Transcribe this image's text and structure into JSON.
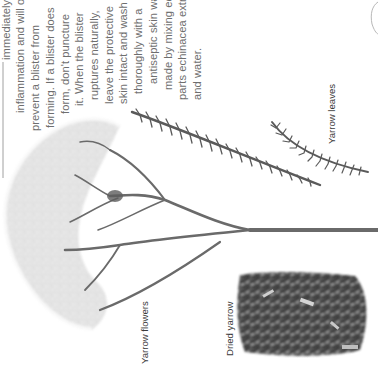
{
  "page": {
    "orientation": "rotated 90 degrees counter-clockwise",
    "body_text_lines": [
      "immediately, this eases pain and",
      "inflammation and will often",
      "prevent a blister from",
      "forming. If a blister does",
      "form, don't puncture",
      "it. When the blister",
      "ruptures naturally,",
      "leave the protective",
      "skin intact and wash",
      "thoroughly with a",
      "antiseptic skin wash",
      "made by mixing equal",
      "parts echinacea extract",
      "and water."
    ],
    "captions": {
      "flowers": "Yarrow flowers",
      "leaves": "Yarrow leaves",
      "dried": "Dried yarrow"
    },
    "images": {
      "flowers": "yarrow-flower-head-with-stems",
      "leaves": "two-yarrow-leaves",
      "dried": "pile-of-dried-yarrow"
    },
    "colors": {
      "text": "#6e6e6e",
      "caption": "#3a3a3a",
      "stem": "#6a6a6a",
      "flower": "#dcdcdc",
      "leaf": "#5a5a5a",
      "dried": "#3c3c3c"
    }
  }
}
